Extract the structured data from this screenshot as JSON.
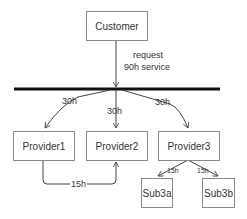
{
  "diagram": {
    "nodes": {
      "customer": "Customer",
      "provider1": "Provider1",
      "provider2": "Provider2",
      "provider3": "Provider3",
      "sub3a": "Sub3a",
      "sub3b": "Sub3b"
    },
    "edges": {
      "request_line1": "request",
      "request_line2": "90h service",
      "to_provider1": "30h",
      "to_provider2": "30h",
      "to_provider3": "30h",
      "p1_to_p2": "15h",
      "p3_to_sub3a": "15h",
      "p3_to_sub3b": "15h"
    },
    "colors": {
      "line": "#444444",
      "bus": "#111111",
      "box_border": "#8a8a8a"
    }
  }
}
